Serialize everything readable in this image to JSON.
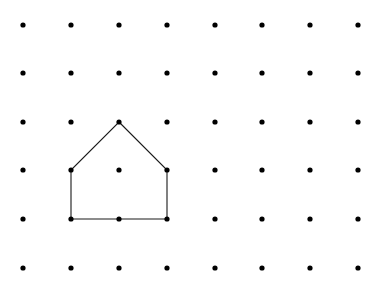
{
  "diagram": {
    "type": "dot-grid-polygon",
    "background": "#ffffff",
    "dot_color": "#000000",
    "line_color": "#1a1a1a",
    "dot_radius": 2.6,
    "line_width": 1.1,
    "grid": {
      "columns": 8,
      "rows": 6,
      "x_positions": [
        23,
        71,
        119,
        167,
        215,
        262,
        310,
        358
      ],
      "y_positions": [
        25,
        73,
        122,
        170,
        219,
        268
      ]
    },
    "polygon": {
      "name": "house-pentagon",
      "vertices_grid": [
        [
          2,
          2
        ],
        [
          3,
          3
        ],
        [
          3,
          4
        ],
        [
          1,
          4
        ],
        [
          1,
          3
        ]
      ],
      "vertices_px": [
        [
          119,
          122
        ],
        [
          167,
          170
        ],
        [
          167,
          219
        ],
        [
          71,
          219
        ],
        [
          71,
          170
        ]
      ]
    }
  }
}
